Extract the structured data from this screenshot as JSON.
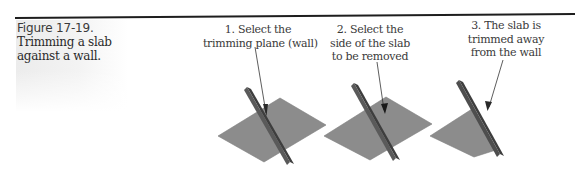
{
  "figure": {
    "number_label": "Figure 17-19.",
    "title_lines": [
      "Trimming a slab",
      "against a wall."
    ]
  },
  "steps": [
    {
      "caption_lines": [
        "1. Select the",
        "trimming plane (wall)"
      ]
    },
    {
      "caption_lines": [
        "2. Select the",
        "side of the slab",
        "to be removed"
      ]
    },
    {
      "caption_lines": [
        "3. The slab is",
        "trimmed away",
        "from the wall"
      ]
    }
  ],
  "colors": {
    "rule": "#1e1e1e",
    "slab": "#8c8c8c",
    "slab_edge": "#7a7a7a",
    "wall_face": "#5a5a5a",
    "wall_side": "#3e3e3e",
    "arrow": "#333333",
    "sidebar_tint": "#ececec"
  }
}
